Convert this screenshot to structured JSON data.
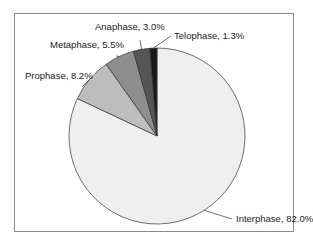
{
  "chart_data": {
    "type": "pie",
    "title": "",
    "labels": [
      "Interphase",
      "Prophase",
      "Metaphase",
      "Anaphase",
      "Telophase"
    ],
    "values": [
      82.0,
      8.2,
      5.5,
      3.0,
      1.3
    ],
    "colors": [
      "#efefef",
      "#bdbdbd",
      "#8e8e8e",
      "#555555",
      "#1a1a1a"
    ],
    "start_angle": "12 o'clock, counter-clockwise after Interphase",
    "legend": "none (leader-line labels)",
    "slice_labels": [
      "Interphase, 82.0%",
      "Prophase, 8.2%",
      "Metaphase, 5.5%",
      "Anaphase, 3.0%",
      "Telophase, 1.3%"
    ]
  }
}
